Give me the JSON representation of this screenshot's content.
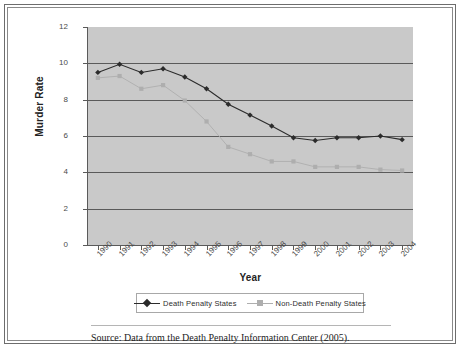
{
  "chart_data": {
    "type": "line",
    "title": "",
    "xlabel": "Year",
    "ylabel": "Murder Rate",
    "grid": true,
    "legend_position": "bottom",
    "xlim": [
      1989.5,
      2004.5
    ],
    "ylim": [
      0,
      12
    ],
    "yticks": [
      0,
      2,
      4,
      6,
      8,
      10,
      12
    ],
    "categories": [
      "1990",
      "1991",
      "1992",
      "1993",
      "1994",
      "1995",
      "1996",
      "1997",
      "1998",
      "1999",
      "2000",
      "2001",
      "2002",
      "2003",
      "2004"
    ],
    "series": [
      {
        "name": "Death Penalty States",
        "marker": "diamond",
        "color": "#2b2b2b",
        "values": [
          9.5,
          9.95,
          9.5,
          9.7,
          9.25,
          8.6,
          7.75,
          7.15,
          6.55,
          5.9,
          5.75,
          5.9,
          5.9,
          6.0,
          5.8
        ]
      },
      {
        "name": "Non-Death Penalty States",
        "marker": "square",
        "color": "#aeaeae",
        "values": [
          9.2,
          9.3,
          8.6,
          8.8,
          7.95,
          6.8,
          5.4,
          5.0,
          4.6,
          4.6,
          4.3,
          4.3,
          4.3,
          4.15,
          4.1
        ]
      }
    ]
  },
  "ylabels": [
    "12",
    "10",
    "8",
    "6",
    "4",
    "2",
    "0"
  ],
  "axis": {
    "y_title": "Murder Rate",
    "x_title": "Year"
  },
  "legend": {
    "items": [
      {
        "label": "Death Penalty States"
      },
      {
        "label": "Non-Death Penalty States"
      }
    ]
  },
  "caption": {
    "source": "Source: Data from the Death Penalty Information Center (2005)."
  },
  "colors": {
    "plot_background": "#c9c9c9",
    "gridline": "#5a5a5a",
    "series_dark": "#2b2b2b",
    "series_light": "#aeaeae",
    "frame": "#6d6d6d"
  }
}
